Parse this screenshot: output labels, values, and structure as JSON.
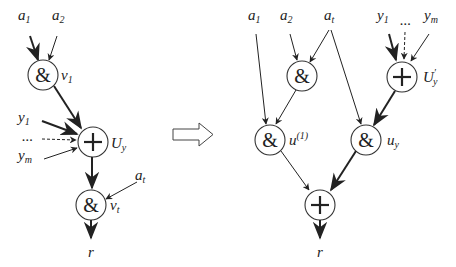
{
  "transform_arrow": {
    "direction": "right",
    "style": "hollow"
  },
  "left_graph": {
    "inputs": {
      "a1": {
        "base": "a",
        "sub": "1"
      },
      "a2": {
        "base": "a",
        "sub": "2"
      },
      "y1": {
        "base": "y",
        "sub": "1"
      },
      "dots": "...",
      "ym": {
        "base": "y",
        "sub": "m"
      },
      "at": {
        "base": "a",
        "sub": "t"
      }
    },
    "nodes": {
      "v1": {
        "op": "&",
        "label_base": "v",
        "label_sub": "1"
      },
      "Uy": {
        "op": "+",
        "label_base": "U",
        "label_sub": "y"
      },
      "vt": {
        "op": "&",
        "label_base": "v",
        "label_sub": "t"
      }
    },
    "output": "r"
  },
  "right_graph": {
    "inputs": {
      "a1": {
        "base": "a",
        "sub": "1"
      },
      "a2": {
        "base": "a",
        "sub": "2"
      },
      "at": {
        "base": "a",
        "sub": "t"
      },
      "y1": {
        "base": "y",
        "sub": "1"
      },
      "dots": "...",
      "ym": {
        "base": "y",
        "sub": "m"
      }
    },
    "nodes": {
      "and_top": {
        "op": "&"
      },
      "Uy_prime": {
        "op": "+",
        "label_base": "U",
        "label_prime": "′",
        "label_sub": "y"
      },
      "u1": {
        "op": "&",
        "label_base": "u",
        "label_sup": "(1)"
      },
      "uy": {
        "op": "&",
        "label_base": "u",
        "label_sub": "y"
      },
      "sum": {
        "op": "+"
      }
    },
    "output": "r"
  }
}
